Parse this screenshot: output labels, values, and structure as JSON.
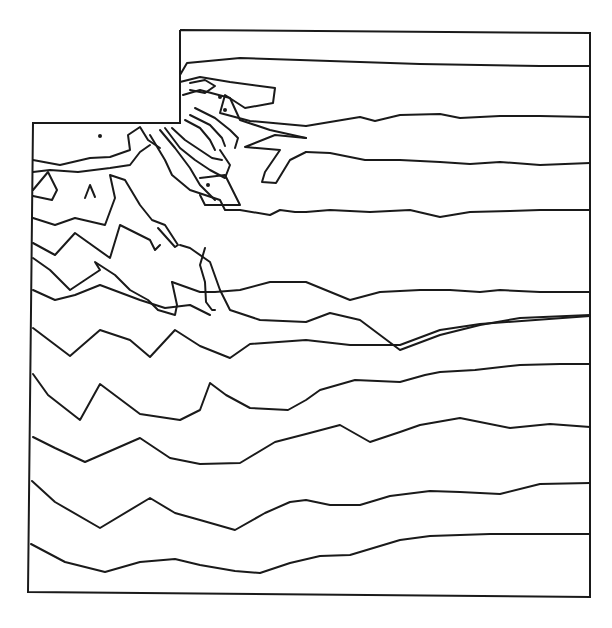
{
  "chart_data": {
    "type": "contour",
    "title": "",
    "xlabel": "",
    "ylabel": "",
    "grid": false,
    "legend": null,
    "colors": {
      "line": "#1a1a1a",
      "background": "#ffffff"
    },
    "domain_boundary": [
      [
        180,
        30
      ],
      [
        590,
        33
      ],
      [
        590,
        597
      ],
      [
        28,
        592
      ],
      [
        33,
        123
      ],
      [
        180,
        123
      ],
      [
        180,
        30
      ]
    ],
    "singular_point": [
      180,
      123
    ],
    "contours": [
      [
        [
          180,
          75
        ],
        [
          187,
          63
        ],
        [
          240,
          58
        ],
        [
          300,
          60
        ],
        [
          360,
          62
        ],
        [
          420,
          64
        ],
        [
          480,
          65
        ],
        [
          540,
          66
        ],
        [
          590,
          66
        ]
      ],
      [
        [
          306,
          126
        ],
        [
          330,
          122
        ],
        [
          360,
          117
        ],
        [
          375,
          121
        ],
        [
          400,
          115
        ],
        [
          440,
          114
        ],
        [
          460,
          118
        ],
        [
          500,
          116
        ],
        [
          540,
          116
        ],
        [
          590,
          117
        ]
      ],
      [
        [
          180,
          82
        ],
        [
          200,
          77
        ],
        [
          230,
          82
        ],
        [
          275,
          88
        ],
        [
          273,
          103
        ],
        [
          245,
          108
        ],
        [
          225,
          95
        ],
        [
          220,
          113
        ],
        [
          250,
          121
        ],
        [
          306,
          126
        ]
      ],
      [
        [
          190,
          83
        ],
        [
          205,
          80
        ],
        [
          215,
          86
        ],
        [
          205,
          93
        ],
        [
          190,
          90
        ]
      ],
      [
        [
          183,
          95
        ],
        [
          200,
          90
        ],
        [
          230,
          98
        ],
        [
          240,
          120
        ],
        [
          270,
          130
        ],
        [
          306,
          138
        ]
      ],
      [
        [
          306,
          152
        ],
        [
          330,
          153
        ],
        [
          365,
          160
        ],
        [
          400,
          160
        ],
        [
          440,
          162
        ],
        [
          470,
          164
        ],
        [
          500,
          162
        ],
        [
          540,
          165
        ],
        [
          590,
          163
        ]
      ],
      [
        [
          306,
          138
        ],
        [
          275,
          135
        ],
        [
          245,
          147
        ],
        [
          280,
          150
        ],
        [
          265,
          172
        ],
        [
          262,
          182
        ],
        [
          276,
          183
        ],
        [
          290,
          160
        ],
        [
          306,
          152
        ]
      ],
      [
        [
          33,
          160
        ],
        [
          60,
          165
        ],
        [
          90,
          158
        ],
        [
          110,
          157
        ],
        [
          130,
          150
        ],
        [
          128,
          135
        ],
        [
          140,
          127
        ],
        [
          148,
          140
        ],
        [
          160,
          148
        ]
      ],
      [
        [
          33,
          172
        ],
        [
          50,
          170
        ],
        [
          78,
          172
        ],
        [
          110,
          168
        ],
        [
          130,
          165
        ],
        [
          140,
          152
        ],
        [
          150,
          145
        ]
      ],
      [
        [
          33,
          190
        ],
        [
          48,
          172
        ],
        [
          57,
          190
        ],
        [
          52,
          200
        ],
        [
          33,
          196
        ]
      ],
      [
        [
          85,
          198
        ],
        [
          90,
          185
        ],
        [
          95,
          197
        ]
      ],
      [
        [
          33,
          218
        ],
        [
          55,
          225
        ],
        [
          75,
          218
        ],
        [
          105,
          225
        ],
        [
          115,
          198
        ],
        [
          110,
          175
        ],
        [
          125,
          180
        ],
        [
          140,
          205
        ],
        [
          152,
          220
        ],
        [
          165,
          225
        ],
        [
          178,
          245
        ],
        [
          175,
          247
        ],
        [
          158,
          228
        ]
      ],
      [
        [
          33,
          243
        ],
        [
          55,
          255
        ],
        [
          75,
          233
        ],
        [
          110,
          258
        ],
        [
          120,
          225
        ],
        [
          150,
          240
        ],
        [
          155,
          250
        ],
        [
          160,
          245
        ]
      ],
      [
        [
          150,
          135
        ],
        [
          165,
          160
        ],
        [
          172,
          175
        ],
        [
          190,
          190
        ],
        [
          220,
          200
        ],
        [
          225,
          210
        ],
        [
          240,
          210
        ],
        [
          270,
          215
        ],
        [
          280,
          210
        ],
        [
          295,
          212
        ],
        [
          306,
          212
        ],
        [
          330,
          210
        ],
        [
          370,
          212
        ],
        [
          410,
          210
        ],
        [
          440,
          217
        ],
        [
          470,
          212
        ],
        [
          510,
          211
        ],
        [
          540,
          210
        ],
        [
          590,
          210
        ]
      ],
      [
        [
          160,
          130
        ],
        [
          175,
          148
        ],
        [
          190,
          168
        ],
        [
          200,
          185
        ],
        [
          215,
          200
        ]
      ],
      [
        [
          165,
          128
        ],
        [
          180,
          148
        ],
        [
          195,
          160
        ],
        [
          210,
          170
        ],
        [
          225,
          178
        ],
        [
          230,
          165
        ],
        [
          220,
          150
        ]
      ],
      [
        [
          172,
          128
        ],
        [
          185,
          140
        ],
        [
          200,
          150
        ],
        [
          212,
          158
        ],
        [
          222,
          160
        ]
      ],
      [
        [
          185,
          120
        ],
        [
          200,
          128
        ],
        [
          210,
          140
        ],
        [
          215,
          150
        ]
      ],
      [
        [
          190,
          115
        ],
        [
          210,
          125
        ],
        [
          222,
          138
        ],
        [
          225,
          146
        ]
      ],
      [
        [
          195,
          108
        ],
        [
          215,
          118
        ],
        [
          230,
          130
        ],
        [
          238,
          138
        ],
        [
          235,
          148
        ]
      ],
      [
        [
          200,
          178
        ],
        [
          225,
          175
        ],
        [
          240,
          205
        ],
        [
          205,
          205
        ],
        [
          200,
          195
        ]
      ],
      [
        [
          33,
          258
        ],
        [
          50,
          270
        ],
        [
          70,
          290
        ],
        [
          85,
          280
        ],
        [
          100,
          270
        ],
        [
          95,
          262
        ],
        [
          115,
          275
        ],
        [
          130,
          290
        ],
        [
          148,
          300
        ],
        [
          158,
          310
        ],
        [
          175,
          315
        ],
        [
          177,
          305
        ],
        [
          172,
          282
        ]
      ],
      [
        [
          33,
          290
        ],
        [
          55,
          300
        ],
        [
          75,
          295
        ],
        [
          100,
          285
        ],
        [
          140,
          300
        ],
        [
          165,
          308
        ],
        [
          190,
          305
        ],
        [
          210,
          315
        ]
      ],
      [
        [
          172,
          282
        ],
        [
          200,
          292
        ],
        [
          215,
          292
        ],
        [
          240,
          290
        ],
        [
          270,
          282
        ],
        [
          306,
          282
        ],
        [
          350,
          300
        ],
        [
          380,
          292
        ],
        [
          420,
          290
        ],
        [
          450,
          290
        ],
        [
          480,
          292
        ],
        [
          500,
          290
        ],
        [
          540,
          292
        ],
        [
          590,
          292
        ]
      ],
      [
        [
          180,
          245
        ],
        [
          190,
          248
        ],
        [
          210,
          262
        ],
        [
          220,
          290
        ],
        [
          230,
          310
        ],
        [
          260,
          320
        ],
        [
          306,
          322
        ],
        [
          330,
          313
        ],
        [
          360,
          320
        ],
        [
          400,
          350
        ],
        [
          440,
          335
        ],
        [
          480,
          325
        ],
        [
          520,
          318
        ],
        [
          590,
          315
        ]
      ],
      [
        [
          205,
          248
        ],
        [
          200,
          265
        ],
        [
          205,
          282
        ],
        [
          206,
          302
        ],
        [
          212,
          310
        ],
        [
          215,
          310
        ]
      ],
      [
        [
          33,
          328
        ],
        [
          70,
          356
        ],
        [
          100,
          330
        ],
        [
          130,
          340
        ],
        [
          150,
          357
        ],
        [
          175,
          330
        ],
        [
          200,
          346
        ],
        [
          230,
          358
        ],
        [
          250,
          344
        ],
        [
          306,
          340
        ],
        [
          350,
          345
        ],
        [
          400,
          345
        ],
        [
          440,
          330
        ],
        [
          480,
          324
        ],
        [
          590,
          316
        ]
      ],
      [
        [
          33,
          374
        ],
        [
          48,
          395
        ],
        [
          80,
          420
        ],
        [
          100,
          384
        ],
        [
          140,
          414
        ],
        [
          180,
          420
        ],
        [
          200,
          410
        ],
        [
          210,
          383
        ],
        [
          226,
          395
        ],
        [
          250,
          408
        ],
        [
          288,
          410
        ],
        [
          306,
          400
        ],
        [
          320,
          390
        ],
        [
          355,
          380
        ],
        [
          400,
          382
        ],
        [
          425,
          375
        ],
        [
          440,
          372
        ],
        [
          475,
          370
        ],
        [
          520,
          365
        ],
        [
          560,
          364
        ],
        [
          590,
          364
        ]
      ],
      [
        [
          33,
          437
        ],
        [
          55,
          448
        ],
        [
          85,
          462
        ],
        [
          140,
          438
        ],
        [
          170,
          458
        ],
        [
          200,
          464
        ],
        [
          240,
          463
        ],
        [
          275,
          442
        ],
        [
          306,
          434
        ],
        [
          340,
          425
        ],
        [
          370,
          442
        ],
        [
          400,
          432
        ],
        [
          420,
          425
        ],
        [
          460,
          418
        ],
        [
          510,
          428
        ],
        [
          550,
          424
        ],
        [
          590,
          427
        ]
      ],
      [
        [
          32,
          481
        ],
        [
          55,
          502
        ],
        [
          100,
          528
        ],
        [
          150,
          498
        ],
        [
          175,
          513
        ],
        [
          200,
          520
        ],
        [
          235,
          530
        ],
        [
          265,
          513
        ],
        [
          290,
          502
        ],
        [
          306,
          500
        ],
        [
          330,
          505
        ],
        [
          360,
          505
        ],
        [
          390,
          496
        ],
        [
          430,
          491
        ],
        [
          460,
          492
        ],
        [
          500,
          494
        ],
        [
          540,
          484
        ],
        [
          590,
          483
        ]
      ],
      [
        [
          31,
          544
        ],
        [
          65,
          562
        ],
        [
          105,
          572
        ],
        [
          140,
          562
        ],
        [
          175,
          559
        ],
        [
          200,
          565
        ],
        [
          235,
          571
        ],
        [
          260,
          573
        ],
        [
          290,
          563
        ],
        [
          320,
          556
        ],
        [
          350,
          555
        ],
        [
          400,
          540
        ],
        [
          430,
          536
        ],
        [
          460,
          535
        ],
        [
          490,
          534
        ],
        [
          530,
          534
        ],
        [
          560,
          534
        ],
        [
          590,
          534
        ]
      ]
    ],
    "point_markers": [
      [
        100,
        136
      ],
      [
        225,
        110
      ],
      [
        208,
        185
      ],
      [
        220,
        97
      ]
    ]
  }
}
